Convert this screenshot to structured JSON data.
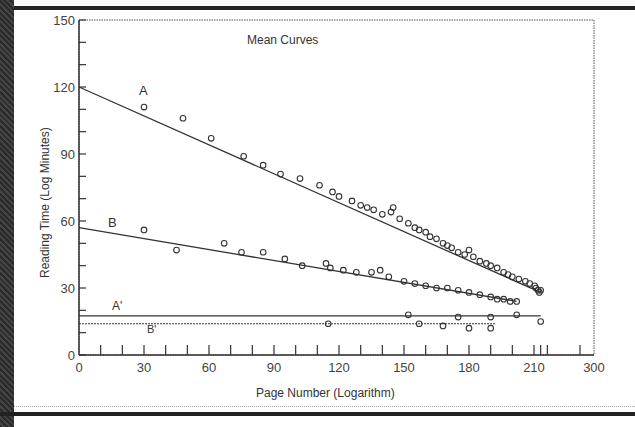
{
  "chart_data": {
    "type": "scatter",
    "title": "Mean Curves",
    "xlabel": "Page Number (Logarithm)",
    "ylabel": "Reading Time (Log Minutes)",
    "xlim": [
      0,
      300
    ],
    "ylim": [
      0,
      150
    ],
    "x_ticks": [
      0,
      30,
      60,
      90,
      120,
      150,
      180,
      210,
      300
    ],
    "y_ticks": [
      0,
      30,
      60,
      90,
      120,
      150
    ],
    "grid": false,
    "legend": "none (inline series labels)",
    "series": [
      {
        "name": "A",
        "fit_line": {
          "x": [
            0,
            220
          ],
          "y": [
            120,
            28
          ]
        },
        "points": [
          [
            30,
            111
          ],
          [
            48,
            106
          ],
          [
            61,
            97
          ],
          [
            76,
            89
          ],
          [
            85,
            85
          ],
          [
            93,
            81
          ],
          [
            102,
            79
          ],
          [
            111,
            76
          ],
          [
            117,
            73
          ],
          [
            120,
            71
          ],
          [
            126,
            69
          ],
          [
            130,
            67
          ],
          [
            133,
            66
          ],
          [
            136,
            65
          ],
          [
            140,
            63
          ],
          [
            144,
            64
          ],
          [
            145,
            66
          ],
          [
            148,
            61
          ],
          [
            152,
            59
          ],
          [
            155,
            57
          ],
          [
            157,
            56
          ],
          [
            160,
            55
          ],
          [
            162,
            53
          ],
          [
            165,
            52
          ],
          [
            168,
            50
          ],
          [
            170,
            49
          ],
          [
            172,
            48
          ],
          [
            175,
            46
          ],
          [
            178,
            45
          ],
          [
            180,
            47
          ],
          [
            182,
            44
          ],
          [
            185,
            42
          ],
          [
            188,
            41
          ],
          [
            190,
            40
          ],
          [
            193,
            39
          ],
          [
            196,
            37
          ],
          [
            198,
            36
          ],
          [
            200,
            35
          ],
          [
            203,
            34
          ],
          [
            206,
            33
          ],
          [
            208,
            32
          ],
          [
            211,
            31
          ],
          [
            213,
            30
          ],
          [
            216,
            29
          ],
          [
            218,
            28
          ],
          [
            220,
            29
          ]
        ]
      },
      {
        "name": "B",
        "fit_line": {
          "x": [
            0,
            202
          ],
          "y": [
            57,
            24
          ]
        },
        "points": [
          [
            30,
            56
          ],
          [
            45,
            47
          ],
          [
            67,
            50
          ],
          [
            75,
            46
          ],
          [
            85,
            46
          ],
          [
            95,
            43
          ],
          [
            103,
            40
          ],
          [
            114,
            41
          ],
          [
            116,
            39
          ],
          [
            122,
            38
          ],
          [
            128,
            37
          ],
          [
            135,
            37
          ],
          [
            139,
            38
          ],
          [
            143,
            35
          ],
          [
            150,
            33
          ],
          [
            155,
            32
          ],
          [
            160,
            31
          ],
          [
            165,
            30
          ],
          [
            170,
            30
          ],
          [
            175,
            29
          ],
          [
            180,
            28
          ],
          [
            185,
            27
          ],
          [
            190,
            26
          ],
          [
            193,
            25
          ],
          [
            196,
            25
          ],
          [
            199,
            24
          ],
          [
            202,
            24
          ]
        ]
      },
      {
        "name": "A'",
        "fit_line": {
          "x": [
            0,
            220
          ],
          "y": [
            17.5,
            17.5
          ]
        },
        "points": [
          [
            152,
            18
          ],
          [
            175,
            17
          ],
          [
            190,
            17
          ],
          [
            202,
            18
          ],
          [
            220,
            15
          ]
        ]
      },
      {
        "name": "B'",
        "fit_line": {
          "x": [
            0,
            192
          ],
          "y": [
            14,
            14
          ]
        },
        "points": [
          [
            115,
            14
          ],
          [
            157,
            14
          ],
          [
            168,
            13
          ],
          [
            180,
            12
          ],
          [
            190,
            12
          ]
        ]
      }
    ],
    "annotations": [
      "A",
      "B",
      "A'",
      "B'",
      "Mean Curves"
    ]
  },
  "labels": {
    "title": "Mean Curves",
    "xlabel": "Page Number (Logarithm)",
    "ylabel": "Reading Time (Log Minutes)",
    "series_a": "A",
    "series_b": "B",
    "series_a_prime": "A'",
    "series_b_prime": "B'",
    "x_ticks": [
      "0",
      "30",
      "60",
      "90",
      "120",
      "150",
      "180",
      "210",
      "300"
    ],
    "y_ticks": [
      "0",
      "30",
      "60",
      "90",
      "120",
      "150"
    ]
  },
  "colors": {
    "ink": "#333333",
    "frame": "#222222",
    "background": "#ffffff"
  }
}
